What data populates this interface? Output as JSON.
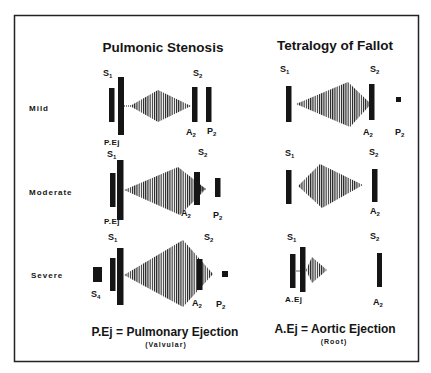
{
  "colors": {
    "ink": "#151515",
    "background": "#ffffff",
    "frame": "#222222"
  },
  "columns": {
    "pulmonic_stenosis": {
      "title": "Pulmonic Stenosis"
    },
    "tetralogy_of_fallot": {
      "title": "Tetralogy of Fallot"
    }
  },
  "rows": [
    {
      "label": "Mild"
    },
    {
      "label": "Moderate"
    },
    {
      "label": "Severe"
    }
  ],
  "sound_labels": {
    "S": "S",
    "A": "A",
    "P": "P",
    "sub1": "1",
    "sub2": "2",
    "sub4": "4",
    "pej": "P.Ej",
    "aej": "A.Ej"
  },
  "legend": {
    "pulmonic": {
      "text": "P.Ej = Pulmonary Ejection",
      "note": "(Valvular)"
    },
    "aortic": {
      "text": "A.Ej = Aortic Ejection",
      "note": "(Root)"
    }
  }
}
